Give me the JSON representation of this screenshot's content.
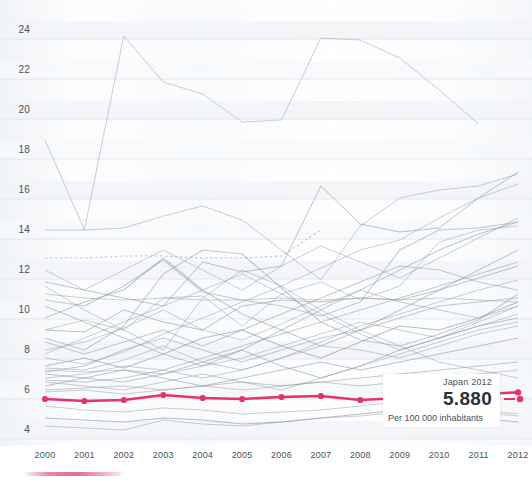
{
  "chart_data": {
    "type": "line",
    "title": "",
    "xlabel": "",
    "ylabel": "",
    "unit_label": "Per 100 000 inhabitants",
    "x": [
      2000,
      2001,
      2002,
      2003,
      2004,
      2005,
      2006,
      2007,
      2008,
      2009,
      2010,
      2011,
      2012
    ],
    "xtick_labels": [
      "2000",
      "2001",
      "2002",
      "2003",
      "2004",
      "2005",
      "2006",
      "2007",
      "2008",
      "2009",
      "2010",
      "2011",
      "2012"
    ],
    "ytick_labels": [
      "4",
      "6",
      "8",
      "10",
      "12",
      "14",
      "16",
      "18",
      "20",
      "22",
      "24"
    ],
    "ytick_values": [
      4,
      6,
      8,
      10,
      12,
      14,
      16,
      18,
      20,
      22,
      24
    ],
    "ylim": [
      3.2,
      24.8
    ],
    "xlim": [
      2000,
      2012
    ],
    "grid": "horizontal-bands",
    "legend_position": "inline-callout",
    "highlight_color": "#e8336a",
    "series_color": "#8e99a4",
    "highlight": {
      "name": "Japan",
      "year": 2012,
      "value": "5.880",
      "value_numeric": 5.88,
      "label": "Japan 2012",
      "unit": "Per 100 000 inhabitants"
    },
    "series": [
      {
        "name": "Japan",
        "highlighted": true,
        "color": "#e8336a",
        "markers": true,
        "values": [
          5.55,
          5.45,
          5.5,
          5.75,
          5.6,
          5.55,
          5.65,
          5.7,
          5.5,
          5.6,
          5.7,
          5.8,
          5.88
        ]
      },
      {
        "name": "series-02",
        "highlighted": false,
        "values": [
          18.5,
          14.0,
          23.7,
          21.4,
          20.8,
          19.4,
          19.5,
          23.6,
          23.5,
          22.6,
          21.0,
          19.3,
          null
        ]
      },
      {
        "name": "series-03",
        "highlighted": false,
        "values": [
          14.0,
          14.0,
          14.1,
          14.7,
          15.2,
          14.5,
          13.0,
          11.5,
          14.2,
          15.6,
          16.0,
          16.2,
          16.8
        ]
      },
      {
        "name": "series-04",
        "highlighted": false,
        "values": [
          12.6,
          12.6,
          12.7,
          12.7,
          12.6,
          12.6,
          12.7,
          14.0,
          null,
          null,
          null,
          null,
          null
        ]
      },
      {
        "name": "series-05",
        "highlighted": false,
        "values": [
          11.4,
          11.0,
          10.6,
          10.2,
          12.4,
          11.9,
          12.2,
          16.2,
          14.3,
          13.9,
          14.1,
          15.6,
          16.9
        ]
      },
      {
        "name": "series-06",
        "highlighted": false,
        "values": [
          10.8,
          10.6,
          10.5,
          10.6,
          10.5,
          10.5,
          10.6,
          10.5,
          10.6,
          10.5,
          10.6,
          10.5,
          10.4
        ]
      },
      {
        "name": "series-07",
        "highlighted": false,
        "values": [
          10.5,
          10.2,
          11.2,
          12.5,
          10.9,
          10.5,
          10.2,
          9.7,
          10.4,
          13.0,
          14.0,
          14.1,
          14.4
        ]
      },
      {
        "name": "series-08",
        "highlighted": false,
        "values": [
          9.0,
          9.5,
          9.0,
          10.6,
          10.7,
          9.2,
          10.8,
          11.4,
          10.5,
          11.2,
          13.4,
          14.0,
          14.2
        ]
      },
      {
        "name": "series-09",
        "highlighted": false,
        "values": [
          9.0,
          8.9,
          10.0,
          9.4,
          9.0,
          10.2,
          10.5,
          10.4,
          10.6,
          10.5,
          11.0,
          11.6,
          12.2
        ]
      },
      {
        "name": "series-10",
        "highlighted": false,
        "values": [
          8.6,
          8.0,
          9.2,
          11.8,
          13.0,
          12.8,
          11.1,
          9.4,
          8.5,
          8.2,
          8.8,
          9.5,
          10.8
        ]
      },
      {
        "name": "series-11",
        "highlighted": false,
        "values": [
          8.0,
          8.4,
          9.1,
          10.0,
          9.0,
          8.5,
          9.3,
          10.2,
          11.0,
          10.4,
          10.0,
          9.6,
          10.2
        ]
      },
      {
        "name": "series-12",
        "highlighted": false,
        "values": [
          7.6,
          7.3,
          7.9,
          8.8,
          9.6,
          10.4,
          11.2,
          12.1,
          13.0,
          13.5,
          14.6,
          15.6,
          16.3
        ]
      },
      {
        "name": "series-13",
        "highlighted": false,
        "values": [
          7.2,
          7.6,
          7.1,
          7.8,
          8.6,
          9.0,
          8.2,
          7.6,
          8.4,
          9.2,
          9.0,
          9.6,
          10.4
        ]
      },
      {
        "name": "series-14",
        "highlighted": false,
        "values": [
          7.1,
          7.0,
          7.5,
          8.2,
          7.4,
          7.0,
          7.6,
          8.4,
          9.2,
          9.8,
          10.4,
          11.0,
          11.5
        ]
      },
      {
        "name": "series-15",
        "highlighted": false,
        "values": [
          7.0,
          6.9,
          7.0,
          6.8,
          7.2,
          7.6,
          8.2,
          8.8,
          9.4,
          9.0,
          8.6,
          9.2,
          9.8
        ]
      },
      {
        "name": "series-16",
        "highlighted": false,
        "values": [
          6.9,
          7.2,
          8.0,
          8.6,
          8.0,
          7.4,
          8.0,
          8.6,
          9.0,
          9.6,
          10.2,
          10.4,
          10.6
        ]
      },
      {
        "name": "series-17",
        "highlighted": false,
        "values": [
          6.8,
          6.6,
          6.4,
          6.8,
          7.4,
          8.0,
          7.2,
          6.6,
          7.2,
          8.0,
          8.6,
          9.2,
          9.6
        ]
      },
      {
        "name": "series-18",
        "highlighted": false,
        "values": [
          6.6,
          6.8,
          7.2,
          7.0,
          6.6,
          7.0,
          7.6,
          8.2,
          8.0,
          7.6,
          8.2,
          8.8,
          9.2
        ]
      },
      {
        "name": "series-19",
        "highlighted": false,
        "values": [
          6.5,
          6.4,
          6.6,
          7.0,
          7.6,
          8.2,
          8.8,
          9.4,
          10.0,
          10.6,
          11.2,
          11.8,
          12.4
        ]
      },
      {
        "name": "series-20",
        "highlighted": false,
        "values": [
          6.4,
          6.2,
          6.0,
          6.4,
          6.8,
          6.4,
          6.0,
          6.6,
          7.2,
          7.8,
          8.4,
          9.0,
          9.4
        ]
      },
      {
        "name": "series-21",
        "highlighted": false,
        "values": [
          6.2,
          6.6,
          7.0,
          6.6,
          6.2,
          6.6,
          7.0,
          7.4,
          7.0,
          7.4,
          7.8,
          8.2,
          8.6
        ]
      },
      {
        "name": "series-22",
        "highlighted": false,
        "values": [
          6.0,
          6.1,
          6.2,
          6.0,
          6.2,
          6.4,
          6.2,
          6.4,
          6.6,
          6.8,
          7.0,
          7.2,
          7.4
        ]
      },
      {
        "name": "series-23",
        "highlighted": false,
        "values": [
          5.9,
          6.0,
          5.8,
          6.0,
          6.2,
          6.0,
          6.2,
          6.4,
          6.2,
          6.4,
          6.6,
          6.8,
          7.0
        ]
      },
      {
        "name": "series-24",
        "highlighted": false,
        "values": [
          5.2,
          5.0,
          4.9,
          5.1,
          5.0,
          4.8,
          4.9,
          5.0,
          5.2,
          5.4,
          5.2,
          5.0,
          4.8
        ]
      },
      {
        "name": "series-25",
        "highlighted": false,
        "values": [
          4.6,
          4.5,
          4.4,
          4.6,
          4.5,
          4.3,
          4.4,
          4.6,
          4.8,
          5.0,
          4.8,
          4.6,
          4.4
        ]
      },
      {
        "name": "series-26",
        "highlighted": false,
        "values": [
          4.2,
          4.1,
          4.0,
          4.5,
          4.3,
          4.2,
          4.4,
          4.6,
          4.7,
          4.9,
          5.1,
          4.9,
          4.7
        ]
      },
      {
        "name": "series-27",
        "highlighted": false,
        "values": [
          11.2,
          10.0,
          9.0,
          8.0,
          10.6,
          12.0,
          11.2,
          10.0,
          9.0,
          8.2,
          7.4,
          7.0,
          6.6
        ]
      },
      {
        "name": "series-28",
        "highlighted": false,
        "values": [
          9.6,
          10.4,
          11.0,
          12.6,
          11.0,
          9.8,
          9.0,
          8.2,
          9.0,
          10.0,
          11.0,
          12.0,
          13.0
        ]
      },
      {
        "name": "series-29",
        "highlighted": false,
        "values": [
          10.2,
          9.4,
          8.6,
          7.8,
          7.2,
          8.0,
          9.0,
          10.0,
          11.0,
          12.0,
          13.0,
          13.8,
          14.4
        ]
      },
      {
        "name": "series-30",
        "highlighted": false,
        "values": [
          7.8,
          8.6,
          9.4,
          10.2,
          11.0,
          11.8,
          10.8,
          9.8,
          8.8,
          8.0,
          8.6,
          9.4,
          10.2
        ]
      },
      {
        "name": "series-31",
        "highlighted": false,
        "values": [
          8.4,
          7.8,
          8.4,
          9.0,
          8.2,
          9.0,
          9.8,
          10.6,
          11.4,
          12.2,
          12.0,
          11.4,
          11.0
        ]
      },
      {
        "name": "series-32",
        "highlighted": false,
        "values": [
          12.0,
          11.0,
          12.0,
          13.0,
          12.0,
          11.0,
          12.2,
          13.2,
          12.4,
          11.6,
          12.6,
          13.6,
          14.6
        ]
      }
    ]
  }
}
